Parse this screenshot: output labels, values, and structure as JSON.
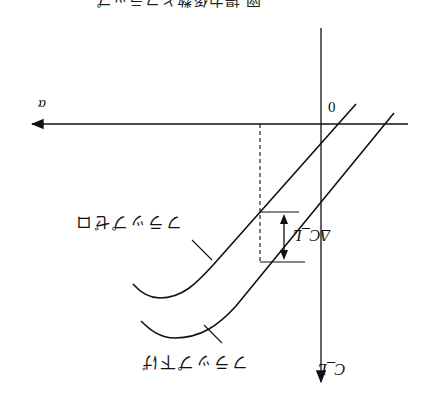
{
  "title_partial": "図 揚力係数とフラップ",
  "axes": {
    "x_label": "α",
    "y_label": "C_L",
    "origin_label": "0"
  },
  "curves": [
    {
      "name": "flap-zero",
      "label": "フラップゼロ"
    },
    {
      "name": "flap-down",
      "label": "フラップ下げ"
    }
  ],
  "annotation": {
    "delta_label": "ΔC_L"
  },
  "orientation": "rotated 180°",
  "colors": {
    "line": "#111111",
    "background": "#ffffff"
  }
}
